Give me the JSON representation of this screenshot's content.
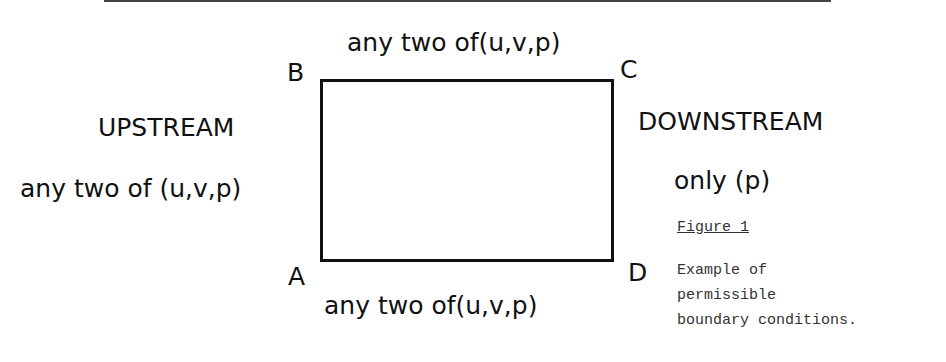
{
  "diagram": {
    "corners": {
      "a": "A",
      "b": "B",
      "c": "C",
      "d": "D"
    },
    "top_label": "any two of(u,v,p)",
    "bottom_label": "any two of(u,v,p)",
    "upstream": {
      "title": "UPSTREAM",
      "condition": "any two of (u,v,p)"
    },
    "downstream": {
      "title": "DOWNSTREAM",
      "condition": "only (p)"
    }
  },
  "caption": {
    "figure_label": "Figure 1",
    "lines": [
      "Example of",
      "permissible",
      "boundary conditions."
    ]
  }
}
